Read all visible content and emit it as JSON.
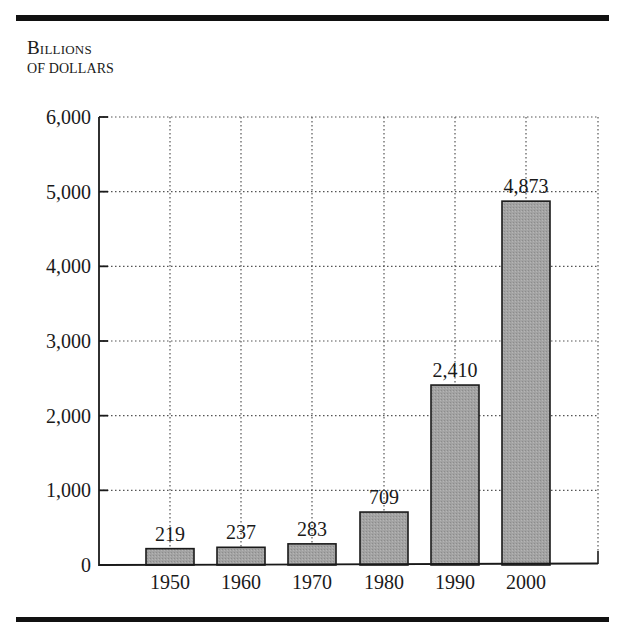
{
  "chart_data": {
    "type": "bar",
    "title": "",
    "ylabel_line1": "Billions",
    "ylabel_line2": "of dollars",
    "xlabel": "",
    "categories": [
      "1950",
      "1960",
      "1970",
      "1980",
      "1990",
      "2000"
    ],
    "values": [
      219,
      237,
      283,
      709,
      2410,
      4873
    ],
    "value_labels": [
      "219",
      "237",
      "283",
      "709",
      "2,410",
      "4,873"
    ],
    "ylim": [
      0,
      6000
    ],
    "yticks": [
      0,
      1000,
      2000,
      3000,
      4000,
      5000,
      6000
    ],
    "ytick_labels": [
      "0",
      "1,000",
      "2,000",
      "3,000",
      "4,000",
      "5,000",
      "6,000"
    ],
    "grid": true,
    "grid_style": "dotted",
    "legend": null,
    "bar_color": "#9a9a9a",
    "bar_edge_color": "#1a1a1a"
  }
}
